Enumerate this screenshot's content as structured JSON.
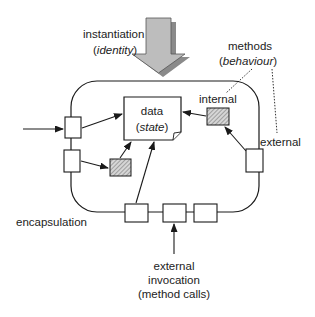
{
  "diagram": {
    "type": "object-model",
    "labels": {
      "instantiation": "instantiation",
      "identity_open": "(",
      "identity": "identity",
      "identity_close": ")",
      "methods": "methods",
      "behaviour_open": "(",
      "behaviour": "behaviour",
      "behaviour_close": ")",
      "internal": "internal",
      "external": "external",
      "data": "data",
      "state_open": "(",
      "state": "state",
      "state_close": ")",
      "encapsulation": "encapsulation",
      "invocation_line1": "external",
      "invocation_line2": "invocation",
      "invocation_line3": "(method calls)"
    },
    "colors": {
      "stroke": "#1a1a1a",
      "arrow_fill": "#b8b8b8",
      "arrow_shadow": "#8a8a8a",
      "hatch": "#9a9a9a",
      "text": "#222222"
    }
  }
}
